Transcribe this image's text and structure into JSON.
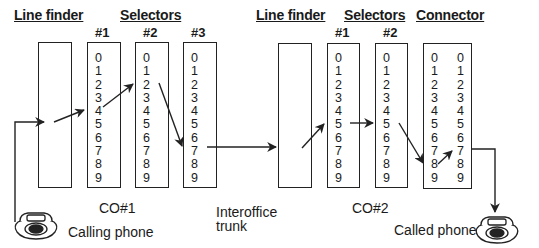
{
  "diagram": {
    "co1": {
      "headings": {
        "line_finder": "Line finder",
        "selectors": "Selectors"
      },
      "selector_numbers": [
        "#1",
        "#2",
        "#3"
      ],
      "label": "CO#1",
      "selectors": [
        {
          "digits": [
            "0",
            "1",
            "2",
            "3",
            "4",
            "5",
            "6",
            "7",
            "8",
            "9"
          ],
          "selected": "4"
        },
        {
          "digits": [
            "0",
            "1",
            "2",
            "3",
            "4",
            "5",
            "6",
            "7",
            "8",
            "9"
          ],
          "selected": "2"
        },
        {
          "digits": [
            "0",
            "1",
            "2",
            "3",
            "4",
            "5",
            "6",
            "7",
            "8",
            "9"
          ],
          "selected": "7"
        }
      ]
    },
    "trunk": {
      "label_line1": "Interoffice",
      "label_line2": "trunk"
    },
    "co2": {
      "headings": {
        "line_finder": "Line finder",
        "selectors": "Selectors",
        "connector": "Connector"
      },
      "selector_numbers": [
        "#1",
        "#2"
      ],
      "label": "CO#2",
      "selectors": [
        {
          "digits": [
            "0",
            "1",
            "2",
            "3",
            "4",
            "5",
            "6",
            "7",
            "8",
            "9"
          ],
          "selected": "5"
        },
        {
          "digits": [
            "0",
            "1",
            "2",
            "3",
            "4",
            "5",
            "6",
            "7",
            "8",
            "9"
          ],
          "selected": "5"
        }
      ],
      "connector": {
        "left_digits": [
          "0",
          "1",
          "2",
          "3",
          "4",
          "5",
          "6",
          "7",
          "8",
          "9"
        ],
        "right_digits": [
          "0",
          "1",
          "2",
          "3",
          "4",
          "5",
          "6",
          "7",
          "8",
          "9"
        ],
        "selected_tens": "8",
        "selected_units": "7"
      }
    },
    "phones": {
      "calling": "Calling phone",
      "called": "Called phone"
    },
    "colors": {
      "line": "#222222",
      "background": "#ffffff"
    }
  }
}
